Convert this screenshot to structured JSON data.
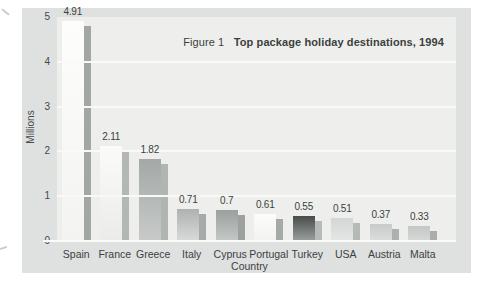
{
  "figure": {
    "title_prefix": "Figure 1",
    "title_bold": "Top package holiday destinations, 1994"
  },
  "chart_data": {
    "type": "bar",
    "xlabel": "Country",
    "ylabel": "Millions",
    "ylim": [
      0,
      5
    ],
    "yticks": [
      0,
      1,
      2,
      3,
      4,
      5
    ],
    "grid": true,
    "legend": "none",
    "categories": [
      "Spain",
      "France",
      "Greece",
      "Italy",
      "Cyprus",
      "Portugal",
      "Turkey",
      "USA",
      "Austria",
      "Malta"
    ],
    "values": [
      4.91,
      2.11,
      1.82,
      0.71,
      0.7,
      0.61,
      0.55,
      0.51,
      0.37,
      0.33
    ],
    "value_labels": [
      "4.91",
      "2.11",
      "1.82",
      "0.71",
      "0.7",
      "0.61",
      "0.55",
      "0.51",
      "0.37",
      "0.33"
    ],
    "bar_styles": [
      {
        "face_top": "#fdfdfc",
        "face_bottom": "#f3f3f1",
        "side": "#a2a7a5"
      },
      {
        "face_top": "#fbfbfa",
        "face_bottom": "#ebecea",
        "side": "#b3b7b5"
      },
      {
        "face_top": "#a4a9a8",
        "face_bottom": "#c7cac9",
        "side": "#b0b4b2"
      },
      {
        "face_top": "#adb1b0",
        "face_bottom": "#d9dbda",
        "side": "#a6aaa9"
      },
      {
        "face_top": "#9aa09e",
        "face_bottom": "#c5c8c7",
        "side": "#9da2a0"
      },
      {
        "face_top": "#fcfcfb",
        "face_bottom": "#f2f2f0",
        "side": "#a5aaa8"
      },
      {
        "face_top": "#474c4b",
        "face_bottom": "#9ba19f",
        "side": "#b6bab8"
      },
      {
        "face_top": "#d3d6d5",
        "face_bottom": "#e5e7e5",
        "side": "#b5b9b7"
      },
      {
        "face_top": "#c7cbca",
        "face_bottom": "#dcdedd",
        "side": "#acb0ae"
      },
      {
        "face_top": "#c3c7c6",
        "face_bottom": "#d7d9d8",
        "side": "#a9adab"
      }
    ],
    "colors": {
      "chart_background": "#dfe1e0",
      "plot_background": "#eeefed",
      "gridline": "#f9faf8",
      "baseline": "#fafbf9",
      "text": "#3c403f"
    }
  }
}
